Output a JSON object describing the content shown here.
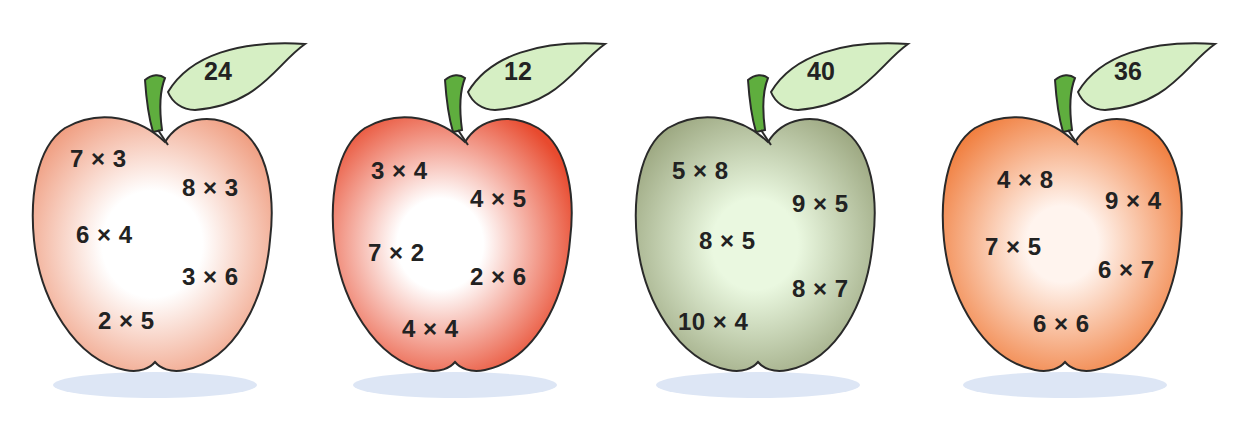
{
  "apples": [
    {
      "answer": "24",
      "color": "peach",
      "colors": {
        "edge": "#ef9a7c",
        "center": "#ffffff"
      },
      "facts": [
        "7 × 3",
        "8 × 3",
        "6 × 4",
        "3 × 6",
        "2 × 5"
      ]
    },
    {
      "answer": "12",
      "color": "red",
      "colors": {
        "edge": "#e84a2e",
        "center": "#ffffff"
      },
      "facts": [
        "3 × 4",
        "4 × 5",
        "7 × 2",
        "2 × 6",
        "4 × 4"
      ]
    },
    {
      "answer": "40",
      "color": "green",
      "colors": {
        "edge": "#9aa57e",
        "center": "#eaf8e0"
      },
      "facts": [
        "5 × 8",
        "9 × 5",
        "8 × 5",
        "8 × 7",
        "10 × 4"
      ]
    },
    {
      "answer": "36",
      "color": "orange",
      "colors": {
        "edge": "#f07a38",
        "center": "#fff4ee"
      },
      "facts": [
        "4 × 8",
        "9 × 4",
        "7 × 5",
        "6 × 7",
        "6 × 6"
      ]
    }
  ],
  "palette": {
    "outline": "#2a2a2a",
    "stem": "#5fae3e",
    "leaf": "#d6efc4",
    "shadow": "#dde6f5",
    "text": "#222222"
  }
}
